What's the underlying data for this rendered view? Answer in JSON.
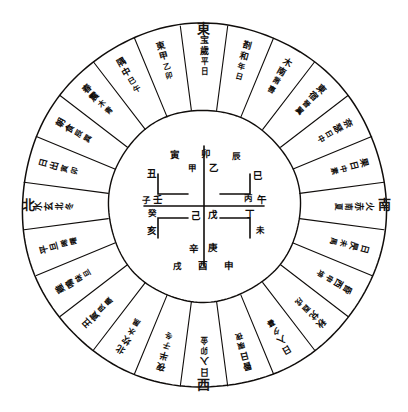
{
  "figure": {
    "ink_color": "#100d0b",
    "background_color": "#ffffff"
  },
  "cardinals": {
    "top": "東",
    "bottom": "西",
    "left": "北",
    "right": "南"
  },
  "rings": {
    "outer_radius": 182,
    "inner_ring_radius": 96,
    "sector_count": 24
  },
  "sectors": [
    {
      "index": 0,
      "angle": -90,
      "glyphs": [
        "宝",
        "歲",
        "平",
        "日"
      ]
    },
    {
      "index": 1,
      "angle": -75,
      "glyphs": [
        "剳",
        "和",
        "年",
        "日"
      ]
    },
    {
      "index": 2,
      "angle": -60,
      "glyphs": [
        "木",
        "南",
        "黹",
        "軎"
      ]
    },
    {
      "index": 3,
      "angle": -45,
      "glyphs": [
        "東",
        "宿",
        "晉",
        "翼"
      ]
    },
    {
      "index": 4,
      "angle": -30,
      "glyphs": [
        "奈",
        "瑟",
        "日",
        "中"
      ]
    },
    {
      "index": 5,
      "angle": -15,
      "glyphs": [
        "果",
        "日",
        "中",
        "素"
      ]
    },
    {
      "index": 6,
      "angle": 0,
      "glyphs": [
        "火",
        "赤",
        "南",
        "夏"
      ]
    },
    {
      "index": 7,
      "angle": 15,
      "glyphs": [
        "日",
        "昃",
        "未",
        "禺"
      ]
    },
    {
      "index": 8,
      "angle": 30,
      "glyphs": [
        "昏",
        "西",
        "申",
        "坤"
      ]
    },
    {
      "index": 9,
      "angle": 45,
      "glyphs": [
        "秋",
        "兌",
        "酉",
        "戌"
      ]
    },
    {
      "index": 10,
      "angle": 60,
      "glyphs": [
        "日",
        "入",
        "夕",
        "暮"
      ]
    },
    {
      "index": 11,
      "angle": 75,
      "glyphs": [
        "昬",
        "日",
        "暝",
        "夜"
      ]
    },
    {
      "index": 12,
      "angle": 90,
      "glyphs": [
        "日",
        "入",
        "卯",
        "金"
      ]
    },
    {
      "index": 13,
      "angle": 105,
      "glyphs": [
        "夜",
        "半",
        "子",
        "冬"
      ]
    },
    {
      "index": 14,
      "angle": 120,
      "glyphs": [
        "北",
        "坎",
        "水",
        "黑"
      ]
    },
    {
      "index": 15,
      "angle": 135,
      "glyphs": [
        "丑",
        "寅",
        "艮",
        "晨"
      ]
    },
    {
      "index": 16,
      "angle": 150,
      "glyphs": [
        "雞",
        "鳴",
        "昧",
        "旦"
      ]
    },
    {
      "index": 17,
      "angle": 165,
      "glyphs": [
        "平",
        "旦",
        "晞",
        "曙"
      ]
    },
    {
      "index": 18,
      "angle": 180,
      "glyphs": [
        "水",
        "玄",
        "北",
        "冬"
      ]
    },
    {
      "index": 19,
      "angle": 195,
      "glyphs": [
        "日",
        "出",
        "寅",
        "卯"
      ]
    },
    {
      "index": 20,
      "angle": 210,
      "glyphs": [
        "朝",
        "食",
        "辰",
        "巽"
      ]
    },
    {
      "index": 21,
      "angle": 225,
      "glyphs": [
        "春",
        "震",
        "木",
        "青"
      ]
    },
    {
      "index": 22,
      "angle": 240,
      "glyphs": [
        "隅",
        "中",
        "巳",
        "午"
      ]
    },
    {
      "index": 23,
      "angle": 255,
      "glyphs": [
        "東",
        "甲",
        "乙",
        "卯"
      ]
    }
  ],
  "inner": {
    "center_marks": [
      "己",
      "戊"
    ],
    "top_marks": [
      "甲",
      "乙"
    ],
    "bottom_marks": [
      "辛",
      "庚"
    ],
    "left_marks": [
      "壬",
      "癸"
    ],
    "right_marks": [
      "丁",
      "丙"
    ],
    "branches": {
      "top_row": [
        "寅",
        "卯",
        "辰"
      ],
      "bottom_row": [
        "戌",
        "酉",
        "申"
      ],
      "left_col": [
        "丑",
        "子",
        "亥"
      ],
      "right_col": [
        "巳",
        "午",
        "未"
      ]
    },
    "labels": [
      {
        "name": "branch-yin",
        "text": "寅",
        "x": 175,
        "y": 155
      },
      {
        "name": "stem-jia",
        "text": "甲",
        "x": 192,
        "y": 168
      },
      {
        "name": "branch-mao",
        "text": "卯",
        "x": 206,
        "y": 154
      },
      {
        "name": "stem-yi",
        "text": "乙",
        "x": 214,
        "y": 168
      },
      {
        "name": "branch-chen",
        "text": "辰",
        "x": 236,
        "y": 156
      },
      {
        "name": "branch-chou",
        "text": "丑",
        "x": 152,
        "y": 174
      },
      {
        "name": "branch-si",
        "text": "巳",
        "x": 258,
        "y": 176
      },
      {
        "name": "branch-zi",
        "text": "子",
        "x": 146,
        "y": 200
      },
      {
        "name": "stem-ren",
        "text": "壬",
        "x": 158,
        "y": 200
      },
      {
        "name": "branch-wu",
        "text": "午",
        "x": 262,
        "y": 200
      },
      {
        "name": "stem-bing",
        "text": "丙",
        "x": 248,
        "y": 198
      },
      {
        "name": "stem-ji",
        "text": "己",
        "x": 196,
        "y": 216
      },
      {
        "name": "stem-wu-earth",
        "text": "戊",
        "x": 213,
        "y": 215
      },
      {
        "name": "stem-gui",
        "text": "癸",
        "x": 152,
        "y": 213
      },
      {
        "name": "stem-ding",
        "text": "丁",
        "x": 250,
        "y": 214
      },
      {
        "name": "branch-hai",
        "text": "亥",
        "x": 152,
        "y": 231
      },
      {
        "name": "branch-wei",
        "text": "未",
        "x": 260,
        "y": 230
      },
      {
        "name": "stem-xin",
        "text": "辛",
        "x": 194,
        "y": 249
      },
      {
        "name": "stem-geng",
        "text": "庚",
        "x": 213,
        "y": 248
      },
      {
        "name": "branch-xu",
        "text": "戌",
        "x": 177,
        "y": 266
      },
      {
        "name": "branch-you",
        "text": "酉",
        "x": 203,
        "y": 266
      },
      {
        "name": "branch-shen",
        "text": "申",
        "x": 229,
        "y": 266
      }
    ]
  }
}
